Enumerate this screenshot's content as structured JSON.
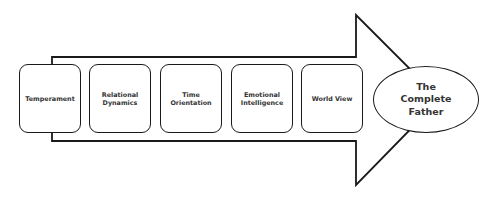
{
  "diagram": {
    "type": "process-arrow",
    "direction": "left-to-right",
    "stages": [
      {
        "label": "Temperament"
      },
      {
        "label": "Relational\nDynamics"
      },
      {
        "label": "Time\nOrientation"
      },
      {
        "label": "Emotional\nIntelligence"
      },
      {
        "label": "World View"
      }
    ],
    "outcome": {
      "label": "The\nComplete\nFather"
    },
    "colors": {
      "stroke": "#1a1a1a",
      "fill": "#ffffff",
      "text": "#333333"
    }
  }
}
